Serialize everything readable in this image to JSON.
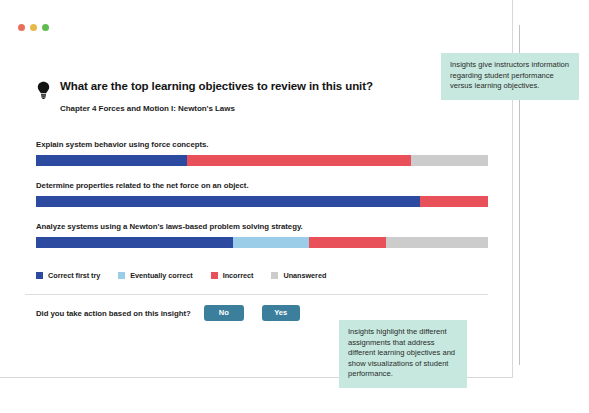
{
  "window": {
    "controls": [
      {
        "name": "close",
        "color": "#e8705a"
      },
      {
        "name": "minimize",
        "color": "#e6b94a"
      },
      {
        "name": "maximize",
        "color": "#62bb52"
      }
    ]
  },
  "header": {
    "icon": "lightbulb-icon",
    "title": "What are the top learning objectives to review in this unit?",
    "subtitle": "Chapter 4 Forces and Motion I: Newton's Laws"
  },
  "chart_data": {
    "type": "bar",
    "orientation": "horizontal",
    "stacked": true,
    "normalized": true,
    "title": "What are the top learning objectives to review in this unit?",
    "subtitle": "Chapter 4 Forces and Motion I: Newton's Laws",
    "xlabel": "",
    "ylabel": "",
    "grid": false,
    "legend_position": "bottom-left",
    "categories": [
      "Explain system behavior using force concepts.",
      "Determine properties related to the net force on an object.",
      "Analyze systems using a Newton's laws-based problem solving strategy."
    ],
    "series": [
      {
        "name": "Correct first try",
        "color": "#2c4ba0",
        "values": [
          33.5,
          85.0,
          43.5
        ]
      },
      {
        "name": "Eventually correct",
        "color": "#9ccde8",
        "values": [
          0.0,
          0.0,
          17.0
        ]
      },
      {
        "name": "Incorrect",
        "color": "#e8505a",
        "values": [
          49.5,
          15.0,
          17.0
        ]
      },
      {
        "name": "Unanswered",
        "color": "#cccccc",
        "values": [
          17.0,
          0.0,
          22.5
        ]
      }
    ]
  },
  "legend": {
    "items": [
      {
        "label": "Correct first try",
        "color": "#2c4ba0"
      },
      {
        "label": "Eventually correct",
        "color": "#9ccde8"
      },
      {
        "label": "Incorrect",
        "color": "#e8505a"
      },
      {
        "label": "Unanswered",
        "color": "#cccccc"
      }
    ]
  },
  "action": {
    "question": "Did you take action based on this insight?",
    "no_label": "No",
    "yes_label": "Yes",
    "button_color": "#3b7f9c"
  },
  "annotations": {
    "top": "Insights give instructors information regarding student performance versus learning objectives.",
    "bottom": "Insights highlight the different assignments that address different learning objectives and show visualizations of student performance.",
    "color": "#c6e8de"
  }
}
